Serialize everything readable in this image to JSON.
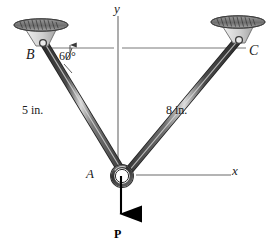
{
  "figure": {
    "background_color": "#ffffff",
    "labels": {
      "joint_b": "B",
      "joint_c": "C",
      "joint_a": "A",
      "axis_y": "y",
      "axis_x": "x",
      "angle": "60°",
      "member_ab_length": "5 in.",
      "member_ac_length": "8 in.",
      "force": "P"
    },
    "colors": {
      "member_dark": "#3a3a3a",
      "member_mid": "#6e6e6e",
      "member_highlight": "#d8d8d8",
      "support_pad": "#8d8d8d",
      "support_pad_light": "#c9c9c9",
      "bracket_fill": "#d5d5d5",
      "axis_line": "#5a5a5a",
      "text": "#1a1a1a",
      "force_arrow": "#000000"
    },
    "geometry": {
      "joint_a": {
        "x": 122,
        "y": 175
      },
      "joint_b": {
        "x": 42,
        "y": 42
      },
      "joint_c": {
        "x": 240,
        "y": 38
      },
      "angle_at_b_degrees": 60,
      "member_ab_label_value": "5 in.",
      "member_ac_label_value": "8 in.",
      "load_direction": "down",
      "y_axis_top": {
        "x": 118,
        "y": 15
      },
      "x_axis_right": {
        "x": 230,
        "y": 174
      }
    },
    "icons": {
      "support_pad_b": "fixed-support-pad-icon",
      "support_pad_c": "fixed-support-pad-icon",
      "pin_a": "pin-joint-icon",
      "force_arrow": "down-arrow-icon"
    }
  }
}
